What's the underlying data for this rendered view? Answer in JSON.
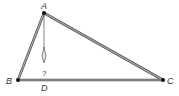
{
  "diagram": {
    "colors": {
      "edge": "#8a8a8a",
      "edge_outline": "#555555",
      "vertex": "#111111",
      "label": "#333333",
      "altitude": "#777777"
    },
    "vertices": [
      {
        "id": "A",
        "label": "A",
        "x": 44,
        "y": 13
      },
      {
        "id": "B",
        "label": "B",
        "x": 18,
        "y": 80
      },
      {
        "id": "C",
        "label": "C",
        "x": 163,
        "y": 80
      }
    ],
    "edges": [
      {
        "from": "A",
        "to": "B"
      },
      {
        "from": "A",
        "to": "C"
      },
      {
        "from": "B",
        "to": "C"
      }
    ],
    "altitude": {
      "from": "A",
      "foot_label": "D",
      "foot_x": 44,
      "foot_y": 80,
      "drawn_to_y": 63,
      "arrow_direction": "down",
      "unknown_label": "?"
    },
    "labels": {
      "A": "A",
      "B": "B",
      "C": "C",
      "D": "D",
      "unknown": "?"
    }
  }
}
